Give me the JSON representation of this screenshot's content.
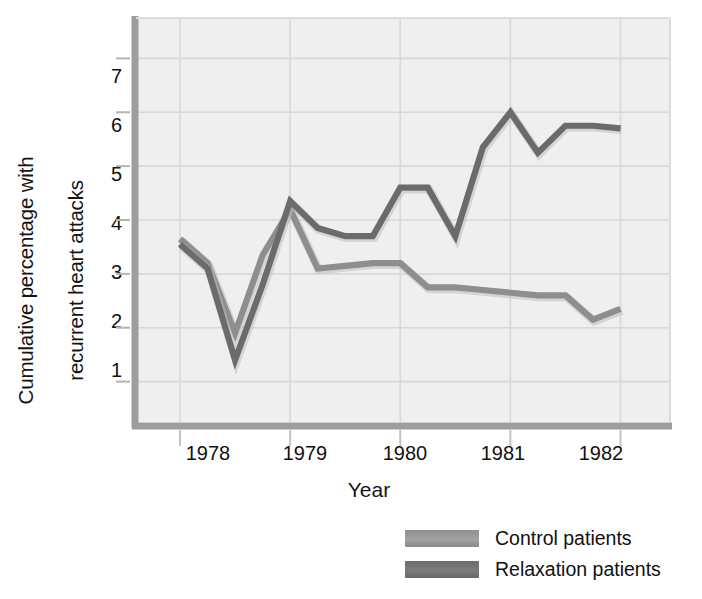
{
  "chart_data": {
    "type": "line",
    "title": "",
    "xlabel": "Year",
    "ylabel": "Cumulative percentage with recurrent heart attacks",
    "ylabel_line1": "Cumulative percentage with",
    "ylabel_line2": "recurrent heart attacks",
    "xticklabels": [
      "1978",
      "1979",
      "1980",
      "1981",
      "1982"
    ],
    "yticklabels": [
      "1",
      "2",
      "3",
      "4",
      "5",
      "6",
      "7"
    ],
    "xlim": [
      1977.6,
      1982.45
    ],
    "ylim": [
      0.25,
      7.75
    ],
    "grid": true,
    "legend_position": "bottom-right",
    "x": [
      1978.0,
      1978.25,
      1978.5,
      1978.75,
      1979.0,
      1979.25,
      1979.5,
      1979.75,
      1980.0,
      1980.25,
      1980.5,
      1980.75,
      1981.0,
      1981.25,
      1981.5,
      1981.75,
      1982.0
    ],
    "series": [
      {
        "name": "Control patients",
        "color": "#8e8e8e",
        "values": [
          3.65,
          3.2,
          1.9,
          3.35,
          4.2,
          3.1,
          3.15,
          3.2,
          3.2,
          2.75,
          2.75,
          2.7,
          2.65,
          2.6,
          2.6,
          2.15,
          2.35
        ]
      },
      {
        "name": "Relaxation patients",
        "color": "#6b6b6b",
        "values": [
          3.55,
          3.1,
          1.4,
          2.8,
          4.35,
          3.85,
          3.7,
          3.7,
          4.6,
          4.6,
          3.7,
          5.35,
          6.0,
          5.25,
          5.75,
          5.75,
          5.7
        ]
      }
    ]
  },
  "legend": {
    "items": [
      {
        "label": "Control patients",
        "color": "#8e8e8e"
      },
      {
        "label": "Relaxation patients",
        "color": "#6b6b6b"
      }
    ]
  },
  "colors": {
    "plot_background": "#efefef",
    "grid": "#d8d8d8",
    "axis": "#9a9a9a",
    "control": "#8e8e8e",
    "relaxation": "#6b6b6b",
    "text": "#111111"
  }
}
